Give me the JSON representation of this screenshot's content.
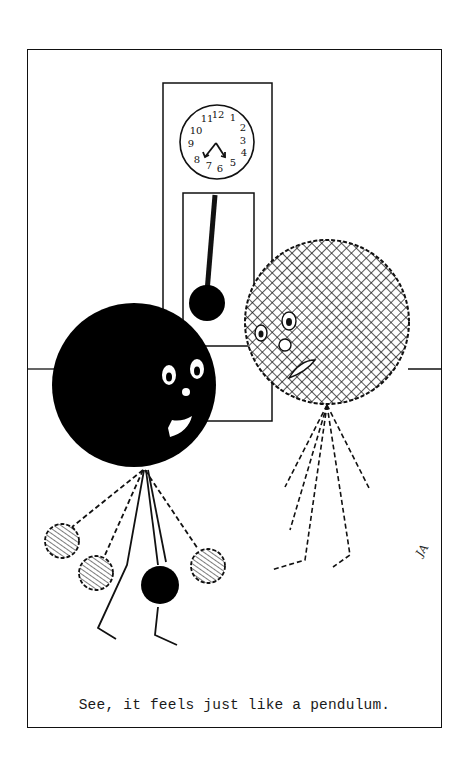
{
  "cartoon": {
    "caption": "See, it feels just like a pendulum.",
    "signature": "JA",
    "clock": {
      "numerals": [
        "12",
        "1",
        "2",
        "3",
        "4",
        "5",
        "6",
        "7",
        "8",
        "9",
        "10",
        "11"
      ]
    },
    "characters": [
      {
        "name": "black-ball",
        "fill": "#000000",
        "role": "pendulum-like character"
      },
      {
        "name": "crosshatched-ball",
        "fill": "crosshatch",
        "role": "observer character"
      }
    ]
  }
}
